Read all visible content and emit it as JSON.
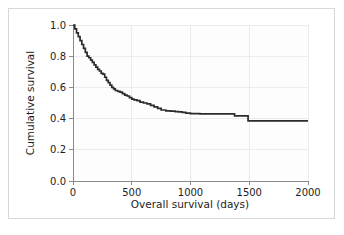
{
  "figure": {
    "background_color": "#ffffff",
    "border_color": "#d8d8d8",
    "plot_background_color": "#fdfdfd"
  },
  "chart_data": {
    "type": "line",
    "subtype": "kaplan-meier-step",
    "title": "",
    "subtitle": "",
    "xlabel": "Overall survival (days)",
    "ylabel": "Cumulative survival",
    "xlim": [
      0,
      2000
    ],
    "ylim": [
      0.0,
      1.0
    ],
    "xticks": [
      0,
      500,
      1000,
      1500,
      2000
    ],
    "xtick_labels": [
      "0",
      "500",
      "1000",
      "1500",
      "2000"
    ],
    "yticks": [
      0.0,
      0.2,
      0.4,
      0.6,
      0.8,
      1.0
    ],
    "ytick_labels": [
      "0.0",
      "0.2",
      "0.4",
      "0.6",
      "0.8",
      "1.0"
    ],
    "grid": true,
    "grid_color": "#ececec",
    "legend": false,
    "legend_position": "none",
    "line_color": "#2b2b2b",
    "series": [
      {
        "name": "Cumulative survival",
        "x": [
          0,
          15,
          30,
          45,
          60,
          75,
          90,
          105,
          120,
          135,
          150,
          165,
          180,
          195,
          210,
          225,
          240,
          255,
          270,
          285,
          300,
          315,
          330,
          345,
          360,
          380,
          400,
          420,
          440,
          460,
          480,
          500,
          520,
          545,
          570,
          600,
          630,
          660,
          690,
          720,
          750,
          790,
          830,
          870,
          900,
          930,
          960,
          1000,
          1080,
          1180,
          1280,
          1370,
          1375,
          1480,
          1490,
          1600,
          1750,
          1900,
          2000
        ],
        "y": [
          1.0,
          0.975,
          0.95,
          0.925,
          0.9,
          0.875,
          0.85,
          0.825,
          0.8,
          0.79,
          0.775,
          0.76,
          0.745,
          0.73,
          0.715,
          0.705,
          0.69,
          0.685,
          0.665,
          0.645,
          0.63,
          0.615,
          0.6,
          0.59,
          0.58,
          0.575,
          0.57,
          0.56,
          0.55,
          0.545,
          0.535,
          0.525,
          0.52,
          0.515,
          0.505,
          0.5,
          0.495,
          0.485,
          0.475,
          0.465,
          0.455,
          0.45,
          0.448,
          0.445,
          0.443,
          0.44,
          0.435,
          0.432,
          0.43,
          0.43,
          0.43,
          0.43,
          0.418,
          0.418,
          0.385,
          0.385,
          0.385,
          0.385,
          0.385
        ]
      }
    ],
    "annotations": []
  }
}
